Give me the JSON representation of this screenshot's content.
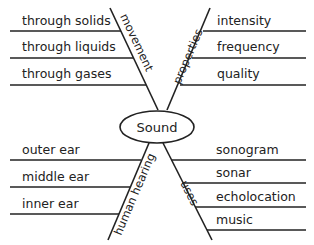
{
  "diagram": {
    "center": "Sound",
    "branches": [
      {
        "name": "movement",
        "items": [
          "through solids",
          "through liquids",
          "through gases"
        ]
      },
      {
        "name": "properties",
        "items": [
          "intensity",
          "frequency",
          "quality"
        ]
      },
      {
        "name": "human hearing",
        "items": [
          "outer ear",
          "middle ear",
          "inner ear"
        ]
      },
      {
        "name": "uses",
        "items": [
          "sonogram",
          "sonar",
          "echolocation",
          "music"
        ]
      }
    ]
  }
}
